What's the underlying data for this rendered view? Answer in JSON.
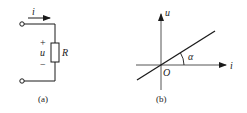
{
  "figure_a": {
    "caption": "(a)",
    "current_label": "i",
    "voltage_label": "u",
    "plus_sign": "+",
    "minus_sign": "−",
    "resistor_label": "R"
  },
  "figure_b": {
    "caption": "(b)",
    "y_axis_label": "u",
    "x_axis_label": "i",
    "origin_label": "O",
    "angle_label": "α"
  },
  "colors": {
    "stroke": "#1a1a1a",
    "axis": "#555555"
  }
}
